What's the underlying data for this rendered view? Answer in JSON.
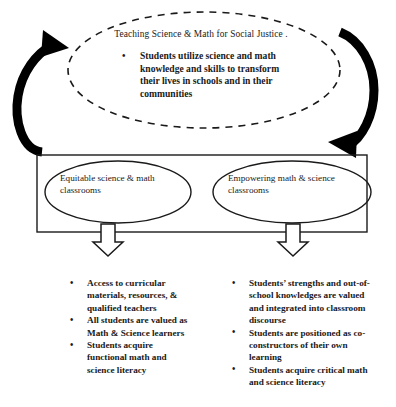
{
  "diagram": {
    "top_node": {
      "heading": "Teaching Science & Math for Social Justice .",
      "bullets": [
        "Students utilize science and math knowledge and skills to transform their lives in schools and in their communities"
      ],
      "shape": "dashed-ellipse"
    },
    "middle_box": {
      "nodes": [
        {
          "label": "Equitable science & math classrooms",
          "shape": "ellipse"
        },
        {
          "label": "Empowering math & science classrooms",
          "shape": "ellipse"
        }
      ]
    },
    "outcomes": {
      "left_column": [
        "Access to curricular materials, resources, & qualified teachers",
        "All students are valued as Math & Science learners",
        "Students acquire functional math and science literacy"
      ],
      "right_column": [
        "Students’ strengths and out-of-school knowledges are valued and integrated into classroom discourse",
        "Students are positioned as co-constructors of their own learning",
        "Students acquire critical math and science literacy"
      ]
    },
    "connectors": [
      {
        "name": "left-curved-arrow",
        "from": "middle-box",
        "to": "top-ellipse",
        "direction": "upward"
      },
      {
        "name": "right-curved-arrow",
        "from": "top-ellipse",
        "to": "middle-box",
        "direction": "downward"
      },
      {
        "name": "left-block-arrow",
        "from": "equitable-classrooms-ellipse",
        "to": "left-outcomes",
        "direction": "down"
      },
      {
        "name": "right-block-arrow",
        "from": "empowering-classrooms-ellipse",
        "to": "right-outcomes",
        "direction": "down"
      }
    ],
    "bullet_glyph": "•",
    "colors": {
      "background": "#ffffff",
      "stroke": "#1a1a1a",
      "text": "#1a1a1a"
    }
  }
}
